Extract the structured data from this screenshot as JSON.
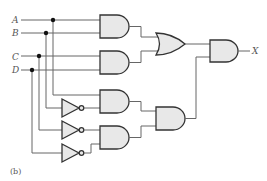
{
  "diagram": {
    "type": "logic-circuit",
    "inputs": [
      "A",
      "B",
      "C",
      "D"
    ],
    "output": "X",
    "caption": "(b)",
    "gates": [
      {
        "id": "and1",
        "kind": "AND",
        "inputs": [
          "A",
          "B"
        ]
      },
      {
        "id": "and2",
        "kind": "AND",
        "inputs": [
          "C",
          "D"
        ]
      },
      {
        "id": "or1",
        "kind": "OR",
        "inputs": [
          "and1",
          "and2"
        ]
      },
      {
        "id": "not1",
        "kind": "NOT",
        "inputs": [
          "B"
        ]
      },
      {
        "id": "not2",
        "kind": "NOT",
        "inputs": [
          "C"
        ]
      },
      {
        "id": "not3",
        "kind": "NOT",
        "inputs": [
          "D"
        ]
      },
      {
        "id": "and3",
        "kind": "AND",
        "inputs": [
          "A",
          "not1"
        ]
      },
      {
        "id": "and4",
        "kind": "AND",
        "inputs": [
          "not2",
          "not3"
        ]
      },
      {
        "id": "and5",
        "kind": "AND",
        "inputs": [
          "and3",
          "and4"
        ]
      },
      {
        "id": "and6",
        "kind": "AND",
        "inputs": [
          "or1",
          "and5"
        ]
      }
    ]
  }
}
